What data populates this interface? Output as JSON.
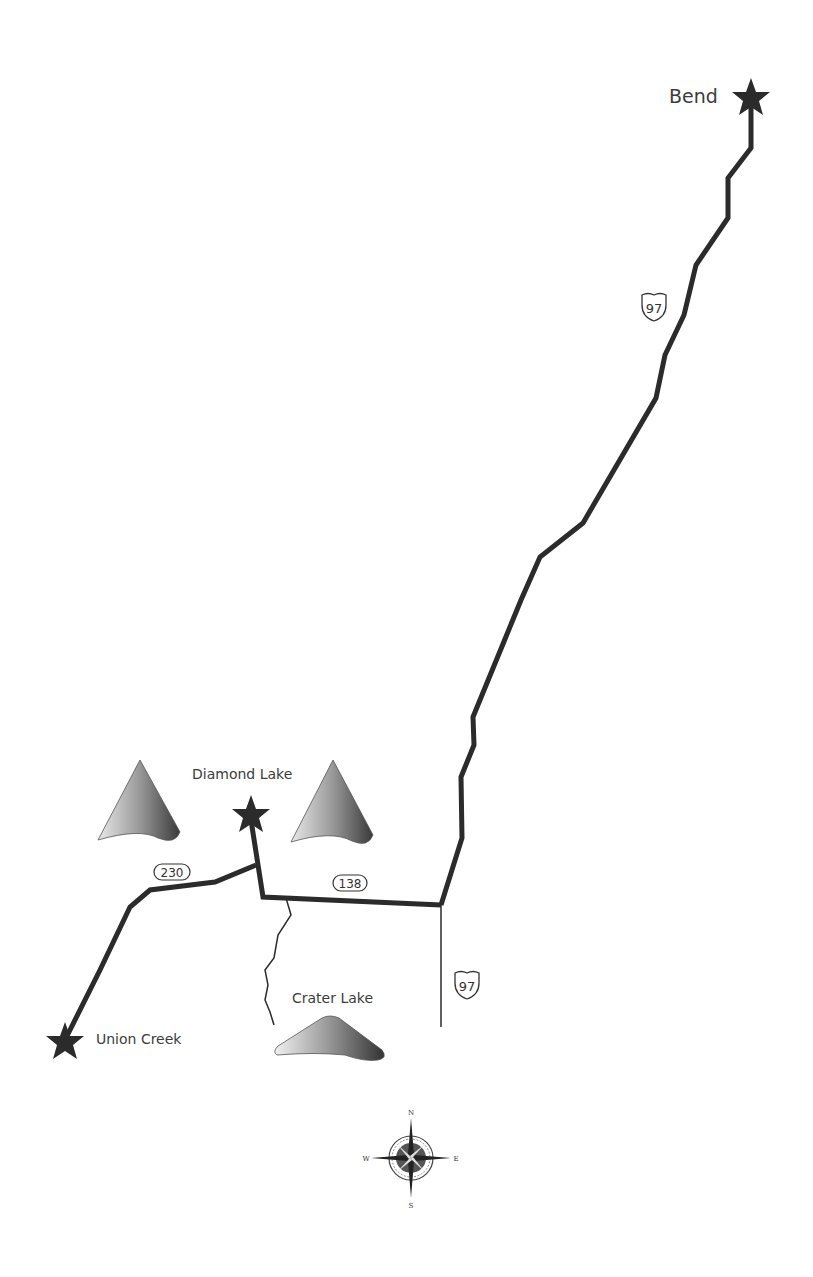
{
  "map": {
    "places": [
      {
        "id": "bend",
        "name": "Bend",
        "x": 751,
        "y": 98
      },
      {
        "id": "diamond-lake",
        "name": "Diamond Lake",
        "x": 251,
        "y": 815
      },
      {
        "id": "union-creek",
        "name": "Union Creek",
        "x": 65,
        "y": 1042
      },
      {
        "id": "crater-lake",
        "name": "Crater Lake"
      }
    ],
    "routes": [
      {
        "id": "us-97-north",
        "label": "97",
        "type": "us-highway"
      },
      {
        "id": "or-138",
        "label": "138",
        "type": "state-highway"
      },
      {
        "id": "or-230",
        "label": "230",
        "type": "state-highway"
      },
      {
        "id": "us-97-south",
        "label": "97",
        "type": "us-highway"
      }
    ],
    "compass": {
      "n": "N",
      "s": "S",
      "e": "E",
      "w": "W"
    },
    "colors": {
      "route": "#2b2b2b",
      "label": "#3c3c3c",
      "background": "#ffffff"
    }
  }
}
